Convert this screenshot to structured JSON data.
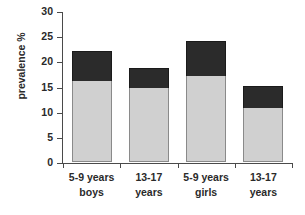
{
  "chart_data": {
    "type": "bar",
    "subtype": "stacked-bar",
    "title": "",
    "xlabel": "",
    "ylabel": "prevalence %",
    "ylim": [
      0,
      30
    ],
    "yticks": [
      0,
      5,
      10,
      15,
      20,
      25,
      30
    ],
    "ytick_labels": [
      "0",
      "5",
      "10",
      "15",
      "20",
      "25",
      "30"
    ],
    "grid": false,
    "legend": "none",
    "categories": [
      "5-9 years boys",
      "13-17 years",
      "5-9 years girls",
      "13-17 years"
    ],
    "category_lines": [
      {
        "line1": "5-9 years",
        "line2": "boys"
      },
      {
        "line1": "13-17",
        "line2": "years"
      },
      {
        "line1": "5-9 years",
        "line2": "girls"
      },
      {
        "line1": "13-17",
        "line2": "years"
      }
    ],
    "series": [
      {
        "name": "lower segment",
        "color": "#d0d0d0",
        "values": [
          16.1,
          14.8,
          17.0,
          10.8
        ]
      },
      {
        "name": "upper segment",
        "color": "#2b2b2b",
        "values": [
          5.9,
          3.8,
          7.1,
          4.3
        ]
      }
    ],
    "totals": [
      22.0,
      18.6,
      24.1,
      15.1
    ]
  },
  "colors": {
    "segment_light": "#d0d0d0",
    "segment_dark": "#2b2b2b",
    "axis": "#4a4a4a",
    "text": "#2a2a2a",
    "background": "#ffffff"
  }
}
